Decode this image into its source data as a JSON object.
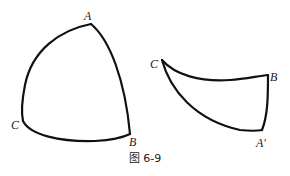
{
  "figure": {
    "caption": "图 6-9",
    "left_shape": {
      "labels": {
        "A": "A",
        "B": "B",
        "C": "C"
      }
    },
    "right_shape": {
      "labels": {
        "C": "C",
        "B": "B",
        "A_prime": "A′"
      }
    }
  }
}
